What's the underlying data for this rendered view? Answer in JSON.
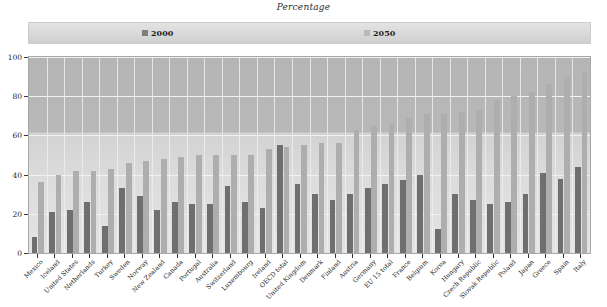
{
  "chart_data": {
    "type": "bar",
    "title": "Percentage",
    "xlabel": "",
    "ylabel": "",
    "ylim": [
      0,
      100
    ],
    "yticks": [
      0,
      20,
      40,
      60,
      80,
      100
    ],
    "grid": true,
    "legend_position": "top",
    "legend": [
      "2000",
      "2050"
    ],
    "categories": [
      "Mexico",
      "Iceland",
      "United States",
      "Netherlands",
      "Turkey",
      "Sweden",
      "Norway",
      "New Zealand",
      "Canada",
      "Portugal",
      "Australia",
      "Switzerland",
      "Luxembourg",
      "Ireland",
      "OECD total",
      "United Kingdom",
      "Denmark",
      "Finland",
      "Austria",
      "Germany",
      "EU 15 total",
      "France",
      "Belgium",
      "Korea",
      "Hungary",
      "Czech Republic",
      "Slovak Republic",
      "Poland",
      "Japan",
      "Greece",
      "Spain",
      "Italy"
    ],
    "series": [
      {
        "name": "2000",
        "color": "#6f6f6f",
        "values": [
          8,
          21,
          22,
          26,
          14,
          33,
          29,
          22,
          26,
          25,
          25,
          34,
          26,
          23,
          55,
          35,
          30,
          27,
          30,
          33,
          35,
          37,
          40,
          12,
          30,
          27,
          25,
          26,
          30,
          41,
          38,
          44
        ]
      },
      {
        "name": "2050",
        "color": "#aeaeae",
        "values": [
          36,
          40,
          42,
          42,
          43,
          46,
          47,
          48,
          49,
          50,
          50,
          50,
          50,
          53,
          54,
          55,
          56,
          56,
          63,
          65,
          66,
          69,
          71,
          71,
          72,
          73,
          78,
          80,
          82,
          86,
          90,
          92
        ]
      }
    ]
  }
}
